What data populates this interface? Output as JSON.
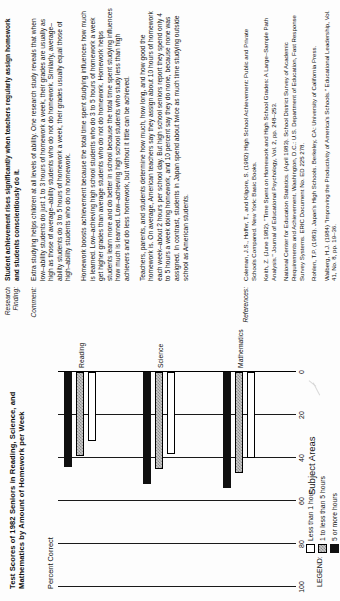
{
  "chart_data": {
    "type": "bar",
    "orientation": "vertical",
    "title": "Test Scores of 1982 Seniors in Reading, Science, and Mathematics by Amount of Homework per Week",
    "ylabel": "Percent Correct",
    "xlabel": "Subject Areas",
    "categories": [
      "Reading",
      "Science",
      "Mathematics"
    ],
    "yticks": [
      "0",
      "20",
      "40",
      "60",
      "80",
      "100"
    ],
    "ylim": [
      0,
      100
    ],
    "grid": true,
    "legend_title": "LEGEND:",
    "series": [
      {
        "name": "Less than 1 hour",
        "fill": "white",
        "values": [
          32,
          38,
          40
        ]
      },
      {
        "name": "1 to less than 5 hours",
        "fill": "gray",
        "values": [
          39,
          45,
          47
        ]
      },
      {
        "name": "5 or more hours",
        "fill": "black",
        "values": [
          44,
          52,
          54
        ]
      }
    ]
  },
  "document": {
    "gutter": {
      "research_finding": "Research\nFinding:",
      "comment": "Comment:",
      "references": "References:"
    },
    "finding": "Student achievement rises significantly when teachers regularly assign homework and students conscientiously do it.",
    "comment_paragraphs": [
      "Extra studying helps children at all levels of ability. One research study reveals that when low–ability students do just 1 to 3 hours of homework a week, their grades are usually as high as those of average–ability students who do not do homework. Similarly, average–ability students do 3 to 5 hours of homework a week, their grades usually equal those of high–ability students who do no homework.",
      "Homework boosts achievement because the total time spent studying influences how much is learned. Low–achieving high school students who do 3 to 5 hours of homework a week get higher grades than average students who do not do homework. Homework helps students learn more and do better in school because the total time spent studying influences how much is learned. Low–achieving high school students who study less than high achievers and do less homework, but without it little can be achieved.",
      "Teachers, parents, and students determine how much, how long, and how good the homework is. On average, American teachers say they assign about 10 hours of homework each week–about 2 hours per school day. But high school seniors report they spend only 4 to 5 hours a week doing homework, and 10 percent say they do none, because none was assigned. In contrast, students in Japan spend about twice as much time studying outside school as American students."
    ],
    "references": [
      "Coleman, J.S., Hoffer, T., and Kilgore, S. (1982) High School Achievement: Public and Private Schools Compared. New York: Basic Books.",
      "Keith, Z. (June 1982). \"Time Spent on Homework and High School Grades: A Large–Sample Path Analysis.\" Journal of Educational Psychology, Vol. 2, pp. 248–253.",
      "National Center for Education Statistics. (April 1983). School District Survey of Academic Requirements and Achievement. Washington, D.C.: U.S. Department of Education, Fast Response Survey Systems. ERIC Document No. ED 225 278.",
      "Rohlen, T.P. (1983). Japan's High Schools. Berkeley, CA: University of California Press.",
      "Walberg, H.J. (1984) \"Improving the Productivity of America's Schools.\" Educational Leadership, Vol. 41, No. 8, pp. 19–36."
    ]
  }
}
